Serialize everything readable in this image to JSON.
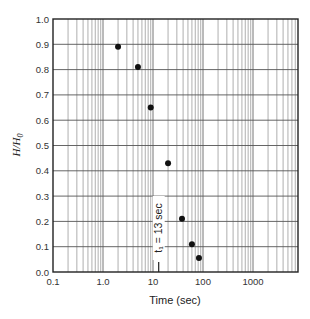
{
  "chart_data": {
    "type": "scatter",
    "title": "",
    "xlabel": "Time (sec)",
    "ylabel": "H/H0",
    "xscale": "log",
    "xlim": [
      0.1,
      7600
    ],
    "ylim": [
      0.0,
      1.0
    ],
    "grid": true,
    "legend": null,
    "x_tick_labels": [
      "0.1",
      "1.0",
      "10",
      "100",
      "1000"
    ],
    "y_tick_labels": [
      "0.0",
      "0.1",
      "0.2",
      "0.3",
      "0.4",
      "0.5",
      "0.6",
      "0.7",
      "0.8",
      "0.9",
      "1.0"
    ],
    "series": [
      {
        "name": "measurements",
        "marker": "filled-circle",
        "x": [
          2,
          5,
          9,
          20,
          38,
          60,
          83
        ],
        "y": [
          0.89,
          0.81,
          0.65,
          0.43,
          0.21,
          0.11,
          0.055
        ]
      }
    ],
    "annotations": [
      {
        "text": "t₁ = 13 sec",
        "x": 13,
        "orientation": "vertical",
        "marker": "tick-at-x-axis"
      }
    ]
  },
  "labels": {
    "xlabel": "Time (sec)",
    "ylabel_main": "H/H",
    "ylabel_sub": "0",
    "annotation": "t₁ = 13 sec"
  }
}
